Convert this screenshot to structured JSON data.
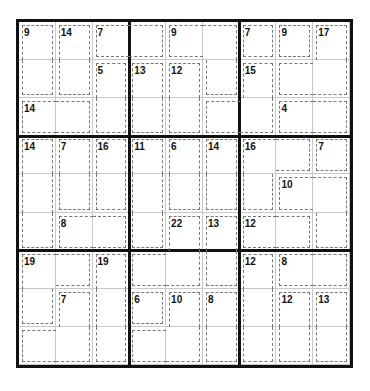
{
  "puzzle": {
    "type": "killer-sudoku",
    "size": 9,
    "cages": [
      {
        "sum": "9",
        "cells": [
          [
            0,
            0
          ],
          [
            1,
            0
          ]
        ]
      },
      {
        "sum": "14",
        "cells": [
          [
            0,
            1
          ],
          [
            1,
            1
          ]
        ]
      },
      {
        "sum": "7",
        "cells": [
          [
            0,
            2
          ],
          [
            0,
            3
          ]
        ]
      },
      {
        "sum": "9",
        "cells": [
          [
            0,
            4
          ],
          [
            0,
            5
          ],
          [
            1,
            5
          ]
        ]
      },
      {
        "sum": "7",
        "cells": [
          [
            0,
            6
          ]
        ]
      },
      {
        "sum": "9",
        "cells": [
          [
            0,
            7
          ]
        ]
      },
      {
        "sum": "17",
        "cells": [
          [
            0,
            8
          ],
          [
            1,
            7
          ],
          [
            1,
            8
          ]
        ]
      },
      {
        "sum": "5",
        "cells": [
          [
            1,
            2
          ],
          [
            2,
            2
          ]
        ]
      },
      {
        "sum": "13",
        "cells": [
          [
            1,
            3
          ],
          [
            2,
            3
          ]
        ]
      },
      {
        "sum": "12",
        "cells": [
          [
            1,
            4
          ],
          [
            2,
            4
          ]
        ]
      },
      {
        "sum": "15",
        "cells": [
          [
            1,
            6
          ],
          [
            2,
            6
          ],
          [
            2,
            5
          ]
        ]
      },
      {
        "sum": "14",
        "cells": [
          [
            2,
            0
          ],
          [
            2,
            1
          ]
        ]
      },
      {
        "sum": "4",
        "cells": [
          [
            2,
            7
          ],
          [
            2,
            8
          ]
        ]
      },
      {
        "sum": "14",
        "cells": [
          [
            3,
            0
          ],
          [
            4,
            0
          ],
          [
            5,
            0
          ]
        ]
      },
      {
        "sum": "7",
        "cells": [
          [
            3,
            1
          ],
          [
            4,
            1
          ]
        ]
      },
      {
        "sum": "16",
        "cells": [
          [
            3,
            2
          ],
          [
            4,
            2
          ]
        ]
      },
      {
        "sum": "11",
        "cells": [
          [
            3,
            3
          ],
          [
            4,
            3
          ],
          [
            5,
            3
          ]
        ]
      },
      {
        "sum": "6",
        "cells": [
          [
            3,
            4
          ],
          [
            4,
            4
          ]
        ]
      },
      {
        "sum": "14",
        "cells": [
          [
            3,
            5
          ],
          [
            4,
            5
          ]
        ]
      },
      {
        "sum": "16",
        "cells": [
          [
            3,
            6
          ],
          [
            3,
            7
          ],
          [
            4,
            6
          ]
        ]
      },
      {
        "sum": "7",
        "cells": [
          [
            3,
            8
          ]
        ]
      },
      {
        "sum": "10",
        "cells": [
          [
            4,
            7
          ],
          [
            4,
            8
          ],
          [
            5,
            8
          ]
        ]
      },
      {
        "sum": "8",
        "cells": [
          [
            5,
            1
          ],
          [
            5,
            2
          ]
        ]
      },
      {
        "sum": "22",
        "cells": [
          [
            5,
            4
          ],
          [
            6,
            4
          ],
          [
            6,
            3
          ]
        ]
      },
      {
        "sum": "13",
        "cells": [
          [
            5,
            5
          ],
          [
            6,
            5
          ]
        ]
      },
      {
        "sum": "12",
        "cells": [
          [
            5,
            6
          ],
          [
            5,
            7
          ]
        ]
      },
      {
        "sum": "19",
        "cells": [
          [
            6,
            0
          ],
          [
            6,
            1
          ],
          [
            7,
            0
          ]
        ]
      },
      {
        "sum": "19",
        "cells": [
          [
            6,
            2
          ],
          [
            7,
            2
          ],
          [
            8,
            2
          ]
        ]
      },
      {
        "sum": "12",
        "cells": [
          [
            6,
            6
          ],
          [
            7,
            6
          ],
          [
            8,
            6
          ]
        ]
      },
      {
        "sum": "8",
        "cells": [
          [
            6,
            7
          ],
          [
            6,
            8
          ]
        ]
      },
      {
        "sum": "7",
        "cells": [
          [
            7,
            1
          ],
          [
            8,
            1
          ],
          [
            8,
            0
          ]
        ]
      },
      {
        "sum": "6",
        "cells": [
          [
            7,
            3
          ]
        ]
      },
      {
        "sum": "10",
        "cells": [
          [
            7,
            4
          ],
          [
            8,
            4
          ],
          [
            8,
            3
          ]
        ]
      },
      {
        "sum": "8",
        "cells": [
          [
            7,
            5
          ],
          [
            8,
            5
          ]
        ]
      },
      {
        "sum": "12",
        "cells": [
          [
            7,
            7
          ],
          [
            8,
            7
          ]
        ]
      },
      {
        "sum": "13",
        "cells": [
          [
            7,
            8
          ],
          [
            8,
            8
          ]
        ]
      }
    ],
    "colors": {
      "grid_line": "#c8c8c8",
      "box_line": "#111111",
      "cage_line": "#777777",
      "clue_text": "#111111"
    }
  }
}
